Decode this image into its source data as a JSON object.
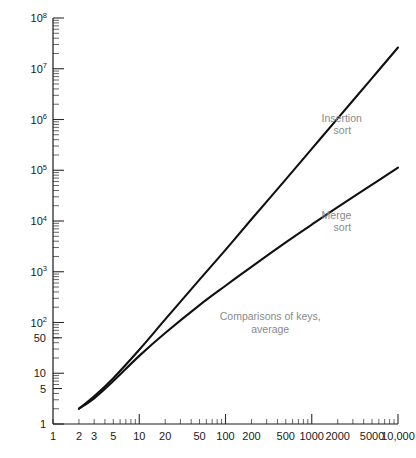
{
  "chart_data": {
    "type": "line",
    "title": "",
    "subtitle": "",
    "xlabel": "",
    "ylabel": "",
    "xscale": "log",
    "yscale": "log",
    "grid": false,
    "legend_position": "inline-annotation",
    "xlim": [
      1,
      10000
    ],
    "ylim": [
      1,
      100000000
    ],
    "xticks": [
      1,
      2,
      3,
      5,
      10,
      20,
      50,
      100,
      200,
      500,
      1000,
      2000,
      5000,
      10000
    ],
    "xticklabels": [
      "1",
      "2",
      "3",
      "5",
      "10",
      "20",
      "50",
      "100",
      "200",
      "500",
      "1000",
      "2000",
      "5000",
      "10,000"
    ],
    "yticks": [
      1,
      5,
      10,
      50,
      100,
      1000,
      10000,
      100000,
      1000000,
      10000000,
      100000000
    ],
    "yticklabels": [
      "1",
      "5",
      "10",
      "50",
      "10^2",
      "10^3",
      "10^4",
      "10^5",
      "10^6",
      "10^7",
      "10^8"
    ],
    "annotations": [
      {
        "name": "insertion-sort-label",
        "text_line1": "Insertion",
        "text_line2": "sort",
        "x": 1300,
        "y": 900000
      },
      {
        "name": "merge-sort-label",
        "text_line1": "Merge",
        "text_line2": "sort",
        "x": 1300,
        "y": 11000
      },
      {
        "name": "caption-label",
        "text_line1": "Comparisons of keys,",
        "text_line2": "average",
        "x": 330,
        "y": 110
      }
    ],
    "series": [
      {
        "name": "Insertion sort",
        "color": "#111111",
        "x": [
          2,
          3,
          5,
          10,
          20,
          50,
          100,
          200,
          500,
          1000,
          2000,
          5000,
          10000
        ],
        "y": [
          2,
          3.5,
          8,
          29,
          115,
          700,
          2700,
          10800,
          66000,
          264000,
          1050000,
          6550000,
          26200000
        ]
      },
      {
        "name": "Merge sort",
        "color": "#111111",
        "x": [
          2,
          3,
          5,
          10,
          20,
          50,
          100,
          200,
          500,
          1000,
          2000,
          5000,
          10000
        ],
        "y": [
          2,
          3.2,
          7,
          22,
          62,
          220,
          530,
          1250,
          3800,
          8500,
          18800,
          52000,
          113000
        ]
      }
    ]
  },
  "axes": {
    "y_axis_name": "y-axis",
    "x_axis_name": "x-axis"
  }
}
